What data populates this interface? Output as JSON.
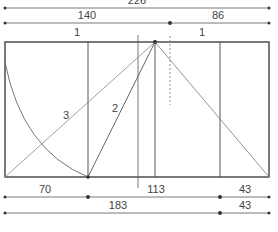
{
  "diagram": {
    "colors": {
      "line": "#3a3a3a",
      "thin": "#7a7a7a",
      "background": "#ffffff"
    },
    "top_dimensions": {
      "total": "226",
      "left": "140",
      "right": "86"
    },
    "unit_labels": {
      "left": "1",
      "right": "1"
    },
    "diagonal_labels": {
      "line_2": "2",
      "line_3": "3"
    },
    "bottom_dimensions": {
      "row1": {
        "left": "70",
        "middle": "113",
        "right": "43"
      },
      "row2": {
        "left": "183",
        "right": "43"
      }
    }
  }
}
